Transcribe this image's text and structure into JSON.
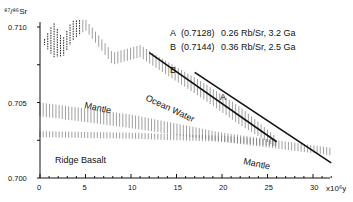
{
  "chart_data": {
    "type": "line",
    "title": "",
    "ylabel": "87/86Sr",
    "xlabel": "x10^6 y",
    "ylim": [
      0.7,
      0.711
    ],
    "xlim": [
      0,
      33
    ],
    "y_ticks": [
      "0.700",
      "0.705",
      "0.710"
    ],
    "x_ticks": [
      "0",
      "5",
      "10",
      "15",
      "20",
      "25",
      "30"
    ],
    "x_unit_label": "x10⁶y",
    "y_unit_label": "⁸⁷/⁸⁶Sr",
    "grid": false,
    "legend": [
      {
        "key": "A",
        "initial": "(0.7128)",
        "desc": "0.26 Rb/Sr, 3.2 Ga"
      },
      {
        "key": "B",
        "initial": "(0.7144)",
        "desc": "0.36 Rb/Sr, 2.5 Ga"
      }
    ],
    "regions": [
      {
        "name": "Ocean Water",
        "label": "Ocean Water",
        "style": "hatched band, dashed at young ages",
        "upper": [
          [
            0.5,
            0.7092
          ],
          [
            1.5,
            0.7103
          ],
          [
            2.5,
            0.7092
          ],
          [
            3.5,
            0.7104
          ],
          [
            5,
            0.7105
          ],
          [
            8,
            0.7083
          ],
          [
            11,
            0.7088
          ],
          [
            14,
            0.7077
          ],
          [
            18,
            0.7063
          ],
          [
            22,
            0.7047
          ],
          [
            26,
            0.7027
          ]
        ],
        "lower": [
          [
            0.5,
            0.7088
          ],
          [
            1.5,
            0.708
          ],
          [
            2.5,
            0.708
          ],
          [
            3.5,
            0.709
          ],
          [
            5,
            0.7098
          ],
          [
            8,
            0.7075
          ],
          [
            11,
            0.708
          ],
          [
            14,
            0.7068
          ],
          [
            18,
            0.7052
          ],
          [
            22,
            0.7035
          ],
          [
            26,
            0.702
          ]
        ]
      },
      {
        "name": "Mantle",
        "label": "Mantle",
        "style": "hatched band",
        "upper": [
          [
            0,
            0.705
          ],
          [
            10,
            0.7042
          ],
          [
            20,
            0.703
          ],
          [
            32,
            0.702
          ]
        ],
        "lower": [
          [
            0,
            0.7041
          ],
          [
            10,
            0.7033
          ],
          [
            20,
            0.7024
          ],
          [
            32,
            0.7015
          ]
        ]
      },
      {
        "name": "Ridge Basalt",
        "label": "Ridge Basalt",
        "style": "hatched band",
        "upper": [
          [
            0,
            0.7031
          ],
          [
            10,
            0.703
          ],
          [
            20,
            0.7028
          ],
          [
            26,
            0.7025
          ]
        ],
        "lower": [
          [
            0,
            0.7027
          ],
          [
            10,
            0.7026
          ],
          [
            20,
            0.7024
          ],
          [
            26,
            0.7021
          ]
        ]
      }
    ],
    "series": [
      {
        "name": "A",
        "x": [
          17,
          32
        ],
        "values": [
          0.707,
          0.701
        ]
      },
      {
        "name": "B",
        "x": [
          12,
          26
        ],
        "values": [
          0.7083,
          0.7024
        ]
      }
    ],
    "annotations": [
      "Ocean Water",
      "Mantle",
      "Mantle",
      "Ridge Basalt",
      "A",
      "B"
    ]
  }
}
